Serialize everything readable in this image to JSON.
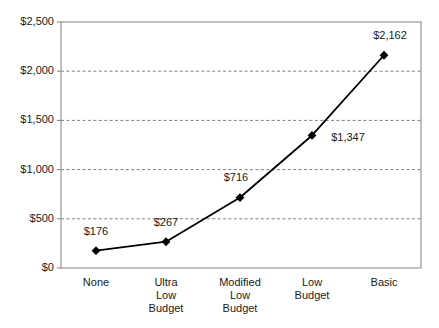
{
  "chart_data": {
    "type": "line",
    "title": "",
    "subtitle": "",
    "xlabel": "",
    "ylabel": "",
    "categories": [
      "None",
      "Ultra Low Budget",
      "Modified Low Budget",
      "Low Budget",
      "Basic"
    ],
    "category_lines": [
      [
        "None"
      ],
      [
        "Ultra",
        "Low",
        "Budget"
      ],
      [
        "Modified",
        "Low",
        "Budget"
      ],
      [
        "Low",
        "Budget"
      ],
      [
        "Basic"
      ]
    ],
    "values": [
      176,
      267,
      716,
      1347,
      2162
    ],
    "point_labels": [
      "$176",
      "$267",
      "$716",
      "$1,347",
      "$2,162"
    ],
    "ylim": [
      0,
      2500
    ],
    "ytick_values": [
      0,
      500,
      1000,
      1500,
      2000,
      2500
    ],
    "ytick_labels": [
      "$0",
      "$500",
      "$1,000",
      "$1,500",
      "$2,000",
      "$2,500"
    ],
    "grid": true,
    "grid_axis": "y",
    "grid_style": "dashed",
    "legend": false,
    "legend_position": "none",
    "marker": "diamond",
    "series_color": "#000000",
    "grid_color": "#808080",
    "axis_color": "#808080",
    "plot_background": "#ffffff"
  },
  "plot_geometry": {
    "left": 61,
    "right": 421,
    "top": 22,
    "bottom": 268,
    "x_positions": [
      96,
      166,
      240,
      312,
      384
    ],
    "label_offsets": [
      {
        "dx": 0,
        "dy": -20
      },
      {
        "dx": 0,
        "dy": -20
      },
      {
        "dx": -4,
        "dy": -21
      },
      {
        "dx": 36,
        "dy": 2
      },
      {
        "dx": 6,
        "dy": -20
      }
    ]
  }
}
